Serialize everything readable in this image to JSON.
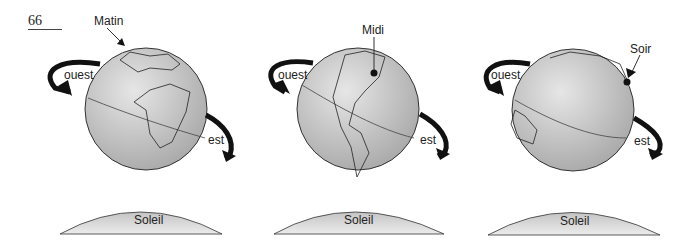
{
  "page_number": "66",
  "panels": [
    {
      "time_label": "Matin",
      "west_label": "ouest",
      "east_label": "est",
      "sun_label": "Soleil"
    },
    {
      "time_label": "Midi",
      "west_label": "ouest",
      "east_label": "est",
      "sun_label": "Soleil"
    },
    {
      "time_label": "Soir",
      "west_label": "ouest",
      "east_label": "est",
      "sun_label": "Soleil"
    }
  ],
  "colors": {
    "globe_fill": "#c8c8c8",
    "globe_edge": "#333333",
    "sun_fill": "#d6d6d6",
    "arrow": "#111111"
  }
}
